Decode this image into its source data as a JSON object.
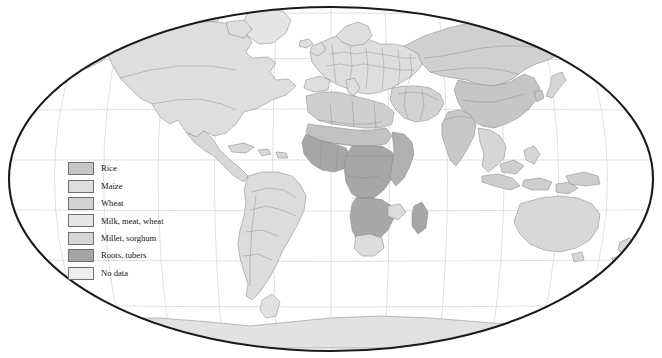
{
  "figure": {
    "type": "choropleth-world-map",
    "projection": "Robinson (elliptical frame)",
    "title": "",
    "background_color": "#ffffff",
    "frame_color": "#1a1a1a",
    "graticule_color": "#cfcfcf",
    "country_border_color": "#8a8a8a"
  },
  "legend": {
    "name": "map-legend",
    "items": [
      {
        "label": "Rice",
        "color": "#c6c6c6"
      },
      {
        "label": "Maize",
        "color": "#dedede"
      },
      {
        "label": "Wheat",
        "color": "#d2d2d2"
      },
      {
        "label": "Milk, meat, wheat",
        "color": "#e6e6e6"
      },
      {
        "label": "Millet, sorghum",
        "color": "#d6d6d6"
      },
      {
        "label": "Roots, tubers",
        "color": "#a6a6a6"
      },
      {
        "label": "No data",
        "color": "#ededed"
      }
    ]
  },
  "map_regions": {
    "north_america": {
      "label": "North America",
      "fill": "#dedede"
    },
    "central_america": {
      "label": "Central America",
      "fill": "#d8d8d8"
    },
    "south_america": {
      "label": "South America",
      "fill": "#dcdcdc"
    },
    "europe": {
      "label": "Europe",
      "fill": "#dedede"
    },
    "north_africa": {
      "label": "North Africa",
      "fill": "#cfcfcf"
    },
    "sahel": {
      "label": "Sahel",
      "fill": "#c2c2c2"
    },
    "west_africa": {
      "label": "West Africa",
      "fill": "#a6a6a6"
    },
    "central_africa": {
      "label": "Central Africa",
      "fill": "#a6a6a6"
    },
    "east_africa": {
      "label": "East Africa",
      "fill": "#b0b0b0"
    },
    "southern_africa": {
      "label": "Southern Africa",
      "fill": "#a8a8a8"
    },
    "madagascar": {
      "label": "Madagascar",
      "fill": "#a6a6a6"
    },
    "south_africa": {
      "label": "South Africa",
      "fill": "#dcdcdc"
    },
    "middle_east": {
      "label": "Middle East",
      "fill": "#d2d2d2"
    },
    "russia": {
      "label": "Russia",
      "fill": "#d0d0d0"
    },
    "china": {
      "label": "China",
      "fill": "#c6c6c6"
    },
    "india": {
      "label": "India",
      "fill": "#c8c8c8"
    },
    "southeast_asia": {
      "label": "Southeast Asia",
      "fill": "#d6d6d6"
    },
    "indonesia": {
      "label": "Indonesia",
      "fill": "#cecece"
    },
    "australia": {
      "label": "Australia",
      "fill": "#d8d8d8"
    },
    "antarctica": {
      "label": "Antarctica",
      "fill": "#e2e2e2"
    },
    "greenland": {
      "label": "Greenland",
      "fill": "#e4e4e4"
    }
  }
}
